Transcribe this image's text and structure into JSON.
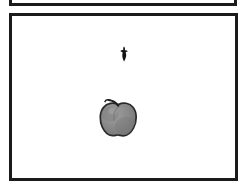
{
  "scene": {
    "title": "Apple on white background",
    "background_color": "#ffffff",
    "width": 246,
    "height": 188
  },
  "panels": {
    "above": {
      "name": "cropped panel above",
      "border_color": "#1b1b1b",
      "border_width": 3,
      "fill": "#ffffff"
    },
    "main": {
      "name": "main framed panel",
      "border_color": "#1b1b1b",
      "border_width": 3,
      "fill": "#ffffff"
    }
  },
  "objects": [
    {
      "id": "bird",
      "label": "small dark silhouette",
      "color": "#141414",
      "x": 127,
      "y": 52
    },
    {
      "id": "apple",
      "label": "gray apple with stem",
      "body_color": "#8b8b8b",
      "shadow_color": "#6f6f6f",
      "highlight_color": "#a3a3a3",
      "outline_color": "#2a2a2a",
      "stem_color": "#1f1f1f",
      "x": 118,
      "y": 115
    }
  ]
}
